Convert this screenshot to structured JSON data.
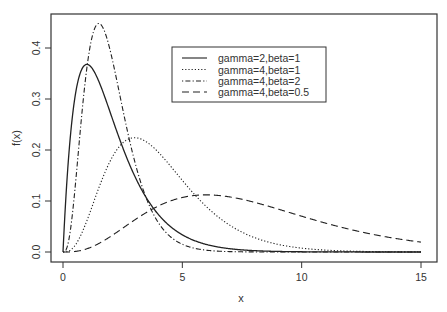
{
  "chart_data": {
    "type": "line",
    "title": "",
    "xlabel": "x",
    "ylabel": "f(x)",
    "xlim": [
      0,
      15
    ],
    "ylim": [
      0,
      0.45
    ],
    "xticks": [
      0,
      5,
      10,
      15
    ],
    "xtick_labels": [
      "0",
      "5",
      "10",
      "15"
    ],
    "yticks": [
      0.0,
      0.1,
      0.2,
      0.3,
      0.4
    ],
    "ytick_labels": [
      "0.0",
      "0.1",
      "0.2",
      "0.3",
      "0.4"
    ],
    "grid": false,
    "legend_position": "top-center",
    "series": [
      {
        "name": "gamma=2,beta=1",
        "shape": 2,
        "rate": 1,
        "linestyle": "solid",
        "peak_x": 1.0,
        "peak_y": 0.368
      },
      {
        "name": "gamma=4,beta=1",
        "shape": 4,
        "rate": 1,
        "linestyle": "dotted",
        "peak_x": 3.0,
        "peak_y": 0.224
      },
      {
        "name": "gamma=4,beta=2",
        "shape": 4,
        "rate": 2,
        "linestyle": "dotdash",
        "peak_x": 1.5,
        "peak_y": 0.448
      },
      {
        "name": "gamma=4,beta=0.5",
        "shape": 4,
        "rate": 0.5,
        "linestyle": "dashed",
        "peak_x": 6.0,
        "peak_y": 0.112
      }
    ],
    "x_sample": [
      0,
      0.5,
      1,
      1.5,
      2,
      3,
      4,
      5,
      6,
      8,
      10,
      12,
      15
    ],
    "values": {
      "gamma=2,beta=1": [
        0,
        0.303,
        0.368,
        0.335,
        0.271,
        0.149,
        0.073,
        0.034,
        0.015,
        0.003,
        0.0,
        0.0,
        0.0
      ],
      "gamma=4,beta=1": [
        0,
        0.013,
        0.061,
        0.126,
        0.18,
        0.224,
        0.195,
        0.14,
        0.089,
        0.029,
        0.008,
        0.002,
        0.0
      ],
      "gamma=4,beta=2": [
        0,
        0.098,
        0.361,
        0.448,
        0.391,
        0.178,
        0.057,
        0.015,
        0.004,
        0.0,
        0.0,
        0.0,
        0.0
      ],
      "gamma=4,beta=0.5": [
        0,
        0.0,
        0.001,
        0.004,
        0.008,
        0.025,
        0.045,
        0.067,
        0.084,
        0.104,
        0.105,
        0.089,
        0.048
      ]
    }
  }
}
